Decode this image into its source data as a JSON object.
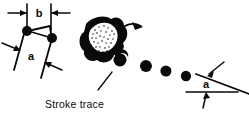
{
  "figure": {
    "caption": "Stroke trace",
    "labels": {
      "left_gap": "b",
      "left_width": "a",
      "right_width": "a"
    },
    "colors": {
      "ink": "#0a0a0a",
      "background": "#ffffff"
    }
  },
  "diagram_elements": {
    "left_detail": {
      "name": "indenter-tip-pair",
      "dots": 2,
      "dimension_top": "b",
      "dimension_lower": "a"
    },
    "center": {
      "name": "debris-particle-cluster",
      "texture": "stippled",
      "motion_arrow": "right"
    },
    "trail": {
      "name": "particle-trail",
      "particle_count": 4
    },
    "right_detail": {
      "name": "groove-width-dimension",
      "dimension": "a"
    }
  }
}
